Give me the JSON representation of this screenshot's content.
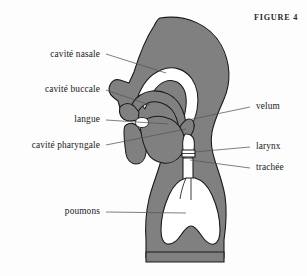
{
  "figure": {
    "caption": "FIGURE 4",
    "background_color": "#fdfdfd",
    "tissue_fill_color": "#808080",
    "cavity_fill_color": "#ffffff",
    "outline_color": "#1a1a1a",
    "leader_line_color": "#4a4a4a",
    "text_color": "#17171a"
  },
  "labels": {
    "cavite_nasale": "cavité nasale",
    "cavite_buccale": "cavité buccale",
    "langue": "langue",
    "cavite_pharyngale": "cavité pharyngale",
    "velum": "velum",
    "larynx": "larynx",
    "trachee": "trachée",
    "poumons": "poumons"
  },
  "annotations": [
    {
      "key": "cavite_nasale",
      "text": "cavité nasale",
      "side": "left",
      "text_x": 100,
      "text_y": 55,
      "line_x1": 106,
      "line_y1": 54,
      "line_x2": 166,
      "line_y2": 73
    },
    {
      "key": "cavite_buccale",
      "text": "cavité buccale",
      "side": "left",
      "text_x": 100,
      "text_y": 90,
      "line_x1": 106,
      "line_y1": 90,
      "line_x2": 150,
      "line_y2": 105
    },
    {
      "key": "langue",
      "text": "langue",
      "side": "left",
      "text_x": 100,
      "text_y": 120,
      "line_x1": 106,
      "line_y1": 120,
      "line_x2": 168,
      "line_y2": 124
    },
    {
      "key": "cavite_pharyngale",
      "text": "cavité pharyngale",
      "side": "left",
      "text_x": 100,
      "text_y": 146,
      "line_x1": 106,
      "line_y1": 145,
      "line_x2": 186,
      "line_y2": 129
    },
    {
      "key": "velum",
      "text": "velum",
      "side": "right",
      "text_x": 256,
      "text_y": 107,
      "line_x1": 250,
      "line_y1": 107,
      "line_x2": 188,
      "line_y2": 120
    },
    {
      "key": "larynx",
      "text": "larynx",
      "side": "right",
      "text_x": 256,
      "text_y": 147,
      "line_x1": 250,
      "line_y1": 147,
      "line_x2": 194,
      "line_y2": 152
    },
    {
      "key": "trachee",
      "text": "trachée",
      "side": "right",
      "text_x": 256,
      "text_y": 168,
      "line_x1": 250,
      "line_y1": 168,
      "line_x2": 190,
      "line_y2": 160
    },
    {
      "key": "poumons",
      "text": "poumons",
      "side": "left",
      "text_x": 100,
      "text_y": 212,
      "line_x1": 106,
      "line_y1": 212,
      "line_x2": 186,
      "line_y2": 213
    }
  ],
  "anatomy_parts": [
    "head-tissue",
    "nasal-cavity",
    "hard-palate",
    "velum-soft-palate",
    "upper-lip",
    "lower-lip-jaw",
    "tongue",
    "pharyngeal-cavity",
    "larynx-ring",
    "trachea",
    "torso-tissue",
    "lungs-cavity",
    "diaphragm-base"
  ]
}
